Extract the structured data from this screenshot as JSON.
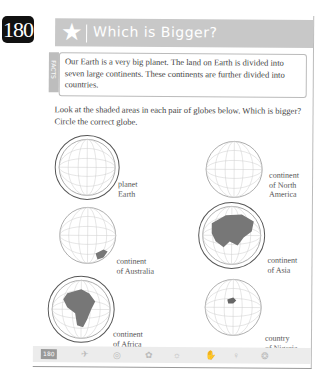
{
  "page_badge": "180",
  "header": {
    "icon": "star-icon",
    "title": "Which is Bigger?"
  },
  "facts": {
    "tab_label": "FACTS",
    "text": "Our Earth is a very big planet. The land on Earth is divided into seven large continents. These continents are further divided into countries."
  },
  "instructions": "Look at the shaded areas in each pair of globes below. Which is bigger? Circle the correct globe.",
  "globes": [
    {
      "label_line1": "planet",
      "label_line2": "Earth",
      "circled": true,
      "shaded": "none"
    },
    {
      "label_line1": "continent",
      "label_line2": "of North",
      "label_line3": "America",
      "circled": false,
      "shaded": "none"
    },
    {
      "label_line1": "continent",
      "label_line2": "of Australia",
      "circled": false,
      "shaded": "australia"
    },
    {
      "label_line1": "continent",
      "label_line2": "of Asia",
      "circled": true,
      "shaded": "asia"
    },
    {
      "label_line1": "continent",
      "label_line2": "of Africa",
      "circled": true,
      "shaded": "africa"
    },
    {
      "label_line1": "country",
      "label_line2": "of Nigeria",
      "circled": false,
      "shaded": "nigeria"
    }
  ],
  "footer": {
    "page_number": "180",
    "icons": [
      "plane-icon",
      "compass-icon",
      "flower-icon",
      "lightbulb-icon",
      "hand-icon",
      "figure-icon",
      "shell-icon"
    ]
  }
}
